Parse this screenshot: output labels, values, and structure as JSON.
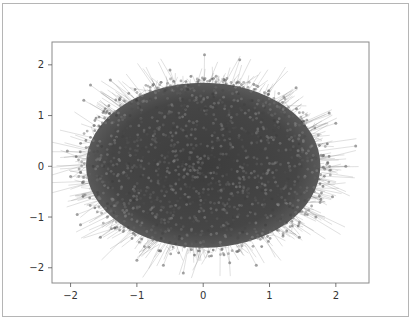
{
  "chart_data": {
    "type": "scatter",
    "subtype": "network-graph-layout",
    "title": "",
    "xlabel": "",
    "ylabel": "",
    "xlim": [
      -2.28,
      2.5
    ],
    "ylim": [
      -2.3,
      2.45
    ],
    "x_ticks": [
      -2,
      -1,
      0,
      1,
      2
    ],
    "y_ticks": [
      -2,
      -1,
      0,
      1,
      2
    ],
    "x_tick_labels": [
      "−2",
      "−1",
      "0",
      "1",
      "2"
    ],
    "y_tick_labels": [
      "−2",
      "−1",
      "0",
      "1",
      "2"
    ],
    "grid": false,
    "legend": null,
    "cloud": {
      "center": [
        0.0,
        0.0
      ],
      "x_extent": [
        -1.9,
        1.9
      ],
      "y_extent": [
        -1.75,
        1.75
      ],
      "node_color": "#555555",
      "edge_color": "#6a6a6a",
      "node_alpha": 0.5,
      "edge_alpha": 0.35
    },
    "outlier_points": [
      [
        0.02,
        2.2
      ],
      [
        0.55,
        2.1
      ],
      [
        -0.5,
        1.9
      ],
      [
        -1.4,
        1.7
      ],
      [
        -1.7,
        1.6
      ],
      [
        1.4,
        1.55
      ],
      [
        1.9,
        1.05
      ],
      [
        2.0,
        0.85
      ],
      [
        2.3,
        0.4
      ],
      [
        2.15,
        0.0
      ],
      [
        1.95,
        -0.6
      ],
      [
        -2.05,
        0.3
      ],
      [
        -2.0,
        -0.2
      ],
      [
        -1.9,
        -0.95
      ],
      [
        -1.85,
        -1.15
      ],
      [
        -1.55,
        -1.4
      ],
      [
        -1.0,
        -1.85
      ],
      [
        -0.3,
        -2.1
      ],
      [
        0.8,
        -1.95
      ],
      [
        0.4,
        -1.9
      ],
      [
        -0.6,
        -1.95
      ],
      [
        1.45,
        -1.4
      ],
      [
        1.7,
        -1.0
      ],
      [
        -1.8,
        1.3
      ]
    ]
  },
  "figure": {
    "frame_color": "#b5b5b5",
    "axes_color": "#8a8a8a",
    "background": "#ffffff"
  }
}
